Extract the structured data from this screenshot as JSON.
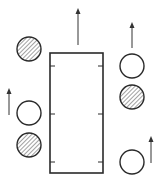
{
  "diagram": {
    "width": 161,
    "height": 188,
    "colors": {
      "stroke": "#2a2a2a",
      "arrow": "#333333",
      "hatch": "#555555",
      "background": "#ffffff"
    },
    "rectangle": {
      "x": 50,
      "y": 53,
      "w": 53,
      "h": 120,
      "ticks_y": [
        66,
        114,
        162
      ],
      "tick_len": 5
    },
    "circles": [
      {
        "id": "left-top",
        "cx": 29,
        "cy": 49,
        "r": 12,
        "fill": "hatched"
      },
      {
        "id": "left-middle",
        "cx": 29,
        "cy": 113,
        "r": 12,
        "fill": "open"
      },
      {
        "id": "left-bottom",
        "cx": 29,
        "cy": 145,
        "r": 12,
        "fill": "hatched"
      },
      {
        "id": "right-top",
        "cx": 132,
        "cy": 66,
        "r": 12,
        "fill": "open"
      },
      {
        "id": "right-middle",
        "cx": 132,
        "cy": 97,
        "r": 12,
        "fill": "hatched"
      },
      {
        "id": "right-bottom",
        "cx": 132,
        "cy": 162,
        "r": 12,
        "fill": "open"
      }
    ],
    "arrows": [
      {
        "id": "center-up",
        "x": 78,
        "y1": 45,
        "y2": 8
      },
      {
        "id": "left-up",
        "x": 9,
        "y1": 115,
        "y2": 88
      },
      {
        "id": "right-top-up",
        "x": 132,
        "y1": 48,
        "y2": 22
      },
      {
        "id": "right-bottom-up",
        "x": 151,
        "y1": 163,
        "y2": 136
      }
    ]
  }
}
